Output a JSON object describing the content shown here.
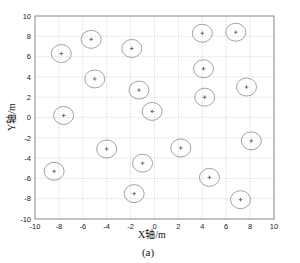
{
  "chart_data": {
    "type": "scatter",
    "title": "",
    "xlabel": "X轴/m",
    "ylabel": "Y轴/m",
    "caption": "(a)",
    "xlim": [
      -10,
      10
    ],
    "ylim": [
      -10,
      10
    ],
    "xticks": [
      -10,
      -8,
      -6,
      -4,
      -2,
      0,
      2,
      4,
      6,
      8,
      10
    ],
    "yticks": [
      -10,
      -8,
      -6,
      -4,
      -2,
      0,
      2,
      4,
      6,
      8,
      10
    ],
    "grid": true,
    "legend": null,
    "marker": "+",
    "marker_enclosure": "ellipse",
    "series": [
      {
        "name": "nodes",
        "points": [
          {
            "x": -7.8,
            "y": 6.3
          },
          {
            "x": -5.3,
            "y": 7.7
          },
          {
            "x": -1.9,
            "y": 6.8
          },
          {
            "x": 4.0,
            "y": 8.3
          },
          {
            "x": 6.8,
            "y": 8.4
          },
          {
            "x": -5.0,
            "y": 3.8
          },
          {
            "x": -1.3,
            "y": 2.7
          },
          {
            "x": 4.1,
            "y": 4.8
          },
          {
            "x": 4.2,
            "y": 2.0
          },
          {
            "x": 7.7,
            "y": 3.0
          },
          {
            "x": -7.6,
            "y": 0.2
          },
          {
            "x": -0.2,
            "y": 0.6
          },
          {
            "x": 2.2,
            "y": -3.0
          },
          {
            "x": -4.0,
            "y": -3.1
          },
          {
            "x": -1.0,
            "y": -4.5
          },
          {
            "x": 8.1,
            "y": -2.3
          },
          {
            "x": -8.4,
            "y": -5.3
          },
          {
            "x": -1.7,
            "y": -7.5
          },
          {
            "x": 4.6,
            "y": -5.9
          },
          {
            "x": 7.2,
            "y": -8.1
          }
        ]
      }
    ]
  },
  "colors": {
    "ring": "#8c8c8c",
    "marker": "#555555",
    "grid": "#c8c8c8",
    "frame": "#6a6a6a"
  }
}
